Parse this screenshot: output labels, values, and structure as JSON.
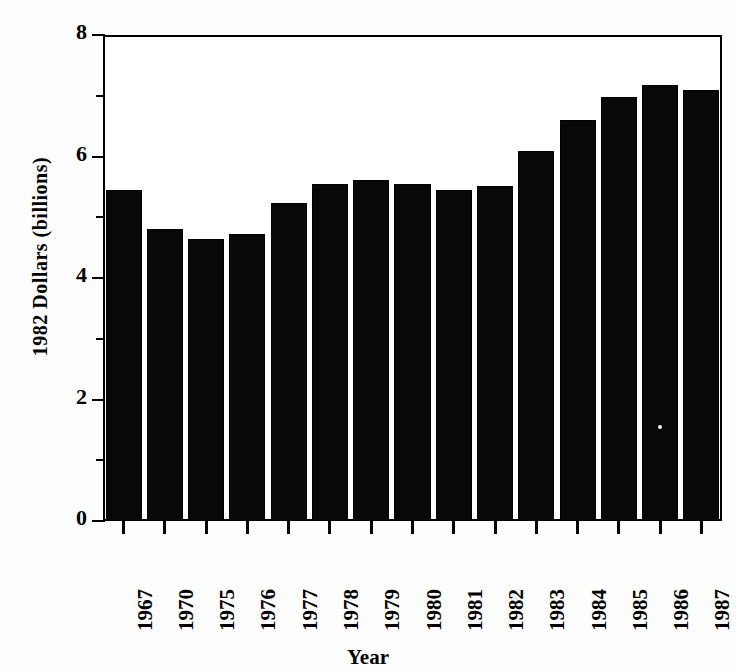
{
  "chart_data": {
    "type": "bar",
    "title": "",
    "xlabel": "Year",
    "ylabel": "1982 Dollars  (billions)",
    "categories": [
      "1967",
      "1970",
      "1975",
      "1976",
      "1977",
      "1978",
      "1979",
      "1980",
      "1981",
      "1982",
      "1983",
      "1984",
      "1985",
      "1986",
      "1987"
    ],
    "values": [
      5.45,
      4.8,
      4.65,
      4.72,
      5.23,
      5.55,
      5.61,
      5.55,
      5.45,
      5.52,
      6.09,
      6.6,
      6.98,
      7.18,
      7.1
    ],
    "ylim": [
      0,
      8
    ],
    "yticks": [
      0,
      2,
      4,
      6,
      8
    ],
    "yticks_minor": [
      1,
      3,
      5,
      7
    ],
    "grid": false,
    "legend": false,
    "bar_color": "#080808",
    "axis_color": "#000000",
    "background": "#ffffff"
  },
  "figure": {
    "top_title_cut_off": "",
    "plot_background": "#ffffff",
    "page_background": "#fdfdfd"
  }
}
